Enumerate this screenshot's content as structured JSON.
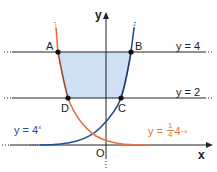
{
  "diagram": {
    "axes": {
      "x_label": "x",
      "y_label": "y",
      "origin_label": "O"
    },
    "lines": [
      {
        "label": "y = 4",
        "value": 4
      },
      {
        "label": "y = 2",
        "value": 2
      }
    ],
    "points": [
      {
        "label": "A",
        "on": "y = 4 and y = (1/4)4^-x"
      },
      {
        "label": "B",
        "on": "y = 4 and y = 4^x"
      },
      {
        "label": "C",
        "on": "y = 2 and y = 4^x"
      },
      {
        "label": "D",
        "on": "y = 2 and y = (1/4)4^-x"
      }
    ],
    "curves": [
      {
        "label_main": "y = 4",
        "label_exp": "x",
        "color": "#1f4e9c"
      },
      {
        "label_prefix": "y = ",
        "frac_num": "1",
        "frac_den": "4",
        "label_base": "4",
        "label_exp": "−x",
        "color": "#e8703a"
      }
    ],
    "shaded_region": {
      "vertices": [
        "A",
        "B",
        "C",
        "D"
      ],
      "color": "#cfe0f4"
    }
  }
}
